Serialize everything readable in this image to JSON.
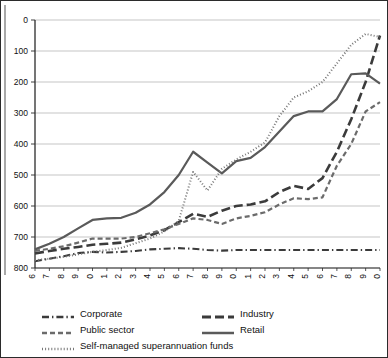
{
  "chart_data": {
    "type": "line",
    "title": "",
    "xlabel": "",
    "ylabel": "",
    "grid": true,
    "legend_position": "bottom",
    "ylim": [
      0,
      800
    ],
    "yticks": [
      0,
      100,
      200,
      300,
      400,
      500,
      600,
      700,
      800
    ],
    "x": [
      1996,
      1997,
      1998,
      1999,
      2000,
      2001,
      2002,
      2003,
      2004,
      2005,
      2006,
      2007,
      2008,
      2009,
      2010,
      2011,
      2012,
      2013,
      2014,
      2015,
      2016,
      2017,
      2018,
      2019,
      2020
    ],
    "categories": [
      "1996",
      "1997",
      "1998",
      "1999",
      "2000",
      "2001",
      "2002",
      "2003",
      "2004",
      "2005",
      "2006",
      "2007",
      "2008",
      "2009",
      "2010",
      "2011",
      "2012",
      "2013",
      "2014",
      "2015",
      "2016",
      "2017",
      "2018",
      "2019",
      "2020"
    ],
    "series": [
      {
        "name": "Corporate",
        "dash": "dash-dot",
        "color": "#3b3b3b",
        "width": 2.1,
        "values": [
          22,
          30,
          38,
          48,
          52,
          50,
          52,
          55,
          60,
          62,
          64,
          62,
          58,
          56,
          58,
          58,
          58,
          58,
          58,
          58,
          58,
          58,
          58,
          58,
          58
        ]
      },
      {
        "name": "Industry",
        "dash": "long-dash",
        "color": "#3b3b3b",
        "width": 2.6,
        "values": [
          47,
          55,
          62,
          68,
          75,
          78,
          82,
          92,
          105,
          122,
          148,
          175,
          165,
          185,
          200,
          205,
          215,
          245,
          265,
          255,
          290,
          375,
          480,
          600,
          750
        ]
      },
      {
        "name": "Public sector",
        "dash": "medium-dash",
        "color": "#6b6b6b",
        "width": 2.2,
        "values": [
          55,
          62,
          70,
          82,
          95,
          95,
          95,
          100,
          112,
          125,
          142,
          160,
          155,
          142,
          160,
          168,
          180,
          205,
          225,
          222,
          228,
          330,
          400,
          505,
          535
        ]
      },
      {
        "name": "Retail",
        "dash": "solid",
        "color": "#5a5a5a",
        "width": 2.2,
        "values": [
          60,
          78,
          100,
          128,
          155,
          160,
          162,
          178,
          205,
          245,
          300,
          375,
          340,
          305,
          345,
          355,
          390,
          440,
          490,
          505,
          505,
          545,
          625,
          628,
          595
        ]
      },
      {
        "name": "Self-managed superannuation funds",
        "dash": "dotted",
        "color": "#777777",
        "width": 2.0,
        "values": [
          25,
          30,
          36,
          44,
          52,
          58,
          65,
          80,
          95,
          118,
          152,
          310,
          250,
          320,
          350,
          375,
          405,
          490,
          550,
          570,
          600,
          660,
          720,
          755,
          745
        ]
      }
    ]
  },
  "legend": {
    "items": [
      {
        "label": "Corporate",
        "icon": "dash-dot-line-icon"
      },
      {
        "label": "Industry",
        "icon": "long-dash-line-icon"
      },
      {
        "label": "Public sector",
        "icon": "medium-dash-line-icon"
      },
      {
        "label": "Retail",
        "icon": "solid-line-icon"
      },
      {
        "label": "Self-managed superannuation funds",
        "icon": "dotted-line-icon"
      }
    ]
  },
  "axes": {
    "y_tick_labels": [
      "800",
      "700",
      "600",
      "500",
      "400",
      "300",
      "200",
      "100",
      "0"
    ],
    "x_tick_labels": [
      "1996",
      "1997",
      "1998",
      "1999",
      "2000",
      "2001",
      "2002",
      "2003",
      "2004",
      "2005",
      "2006",
      "2007",
      "2008",
      "2009",
      "2010",
      "2011",
      "2012",
      "2013",
      "2014",
      "2015",
      "2016",
      "2017",
      "2018",
      "2019",
      "2020"
    ]
  },
  "colors": {
    "grid": "#b6b6b6",
    "axis": "#2b2b2b",
    "border": "#2b2b2b",
    "text": "#111111"
  }
}
